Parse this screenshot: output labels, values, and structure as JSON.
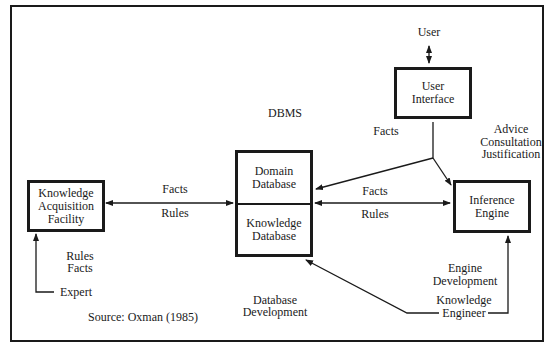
{
  "diagram": {
    "title_label": "DBMS",
    "nodes": {
      "user": {
        "label": "User"
      },
      "user_interface": {
        "line1": "User",
        "line2": "Interface"
      },
      "domain_database": {
        "line1": "Domain",
        "line2": "Database"
      },
      "knowledge_database": {
        "line1": "Knowledge",
        "line2": "Database"
      },
      "knowledge_acquisition_facility": {
        "line1": "Knowledge",
        "line2": "Acquisition",
        "line3": "Facility"
      },
      "inference_engine": {
        "line1": "Inference",
        "line2": "Engine"
      },
      "expert": {
        "label": "Expert"
      },
      "knowledge_engineer": {
        "line1": "Knowledge",
        "line2": "Engineer"
      }
    },
    "edge_labels": {
      "kaf_db_top": "Facts",
      "kaf_db_bottom": "Rules",
      "db_ie_top": "Facts",
      "db_ie_bottom": "Rules",
      "ui_facts": "Facts",
      "ui_advice": [
        "Advice",
        "Consultation",
        "Justification"
      ],
      "expert_to_kaf": [
        "Rules",
        "Facts"
      ],
      "database_development": [
        "Database",
        "Development"
      ],
      "engine_development": [
        "Engine",
        "Development"
      ]
    },
    "source": "Source: Oxman (1985)",
    "colors": {
      "ink": "#1a1a1a",
      "background": "#ffffff"
    }
  }
}
